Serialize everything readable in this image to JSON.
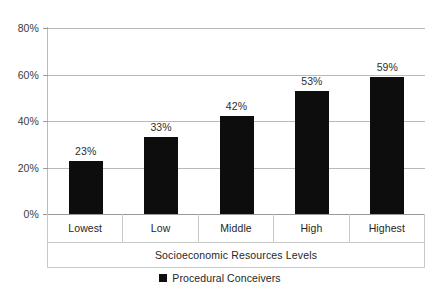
{
  "chart_data": {
    "type": "bar",
    "title": "",
    "subtitle": "",
    "xlabel": "Socioeconomic Resources Levels",
    "ylabel": "",
    "categories": [
      "Lowest",
      "Low",
      "Middle",
      "High",
      "Highest"
    ],
    "values": [
      23,
      33,
      42,
      53,
      59
    ],
    "value_labels": [
      "23%",
      "33%",
      "42%",
      "53%",
      "59%"
    ],
    "series": [
      {
        "name": "Procedural Conceivers",
        "values": [
          23,
          33,
          42,
          53,
          59
        ],
        "color": "#0d0d0d"
      }
    ],
    "ylim": [
      0,
      80
    ],
    "ytick_values": [
      0,
      20,
      40,
      60,
      80
    ],
    "ytick_labels": [
      "0%",
      "20%",
      "40%",
      "60%",
      "80%"
    ],
    "grid": true,
    "grid_axis": "y",
    "legend_position": "bottom",
    "legend_entries": [
      {
        "label": "Procedural Conceivers",
        "marker": "square",
        "color": "#0d0d0d"
      }
    ],
    "background_color": "#ffffff",
    "gridline_color": "#b9b9b9",
    "axis_color": "#9a9a9a"
  }
}
